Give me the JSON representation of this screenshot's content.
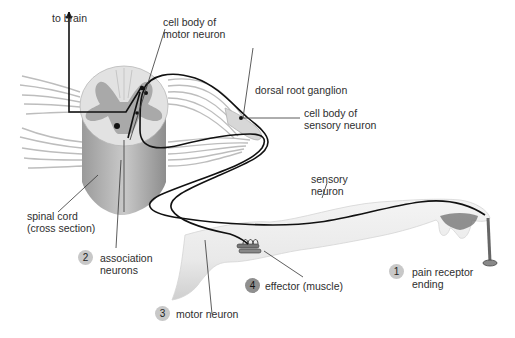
{
  "diagram": {
    "colors": {
      "background": "#ffffff",
      "neuron_line": "#111111",
      "leader_line": "#333333",
      "gray_matter": "#a6a6a6",
      "white_matter": "#e4e4e4",
      "nerve_roots": "#cfcfcf",
      "arm_skin": "#efefef",
      "badge_light": "#c8c8c8",
      "badge_dark": "#8f8f8f"
    },
    "labels": {
      "to_brain": "to brain",
      "cell_body_motor_1": "cell body of",
      "cell_body_motor_2": "motor neuron",
      "dorsal_root_ganglion": "dorsal root ganglion",
      "cell_body_sensory_1": "cell body of",
      "cell_body_sensory_2": "sensory neuron",
      "sensory_neuron_1": "sensory",
      "sensory_neuron_2": "neuron",
      "spinal_cord_1": "spinal cord",
      "spinal_cord_2": "(cross section)"
    },
    "steps": [
      {
        "number": "1",
        "label_line1": "pain receptor",
        "label_line2": "ending"
      },
      {
        "number": "2",
        "label_line1": "association",
        "label_line2": "neurons"
      },
      {
        "number": "3",
        "label_line1": "motor neuron",
        "label_line2": ""
      },
      {
        "number": "4",
        "label_line1": "effector (muscle)",
        "label_line2": ""
      }
    ]
  }
}
